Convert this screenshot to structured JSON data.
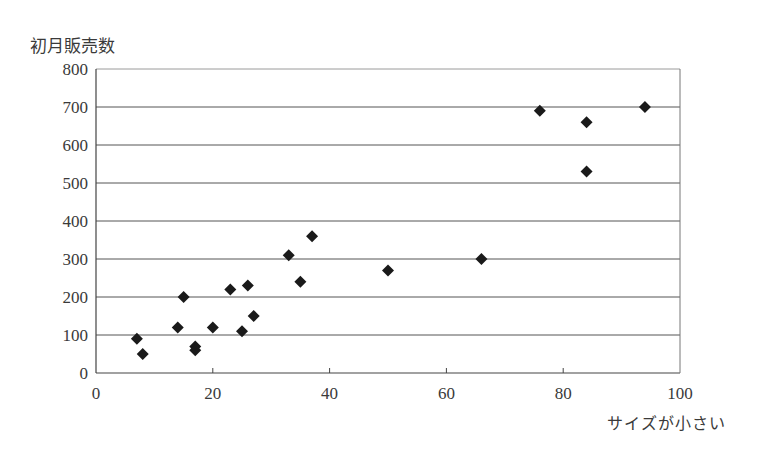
{
  "chart_data": {
    "type": "scatter",
    "title": "",
    "ylabel": "初月販売数",
    "xlabel": "サイズが小さい",
    "xlim": [
      0,
      100
    ],
    "ylim": [
      0,
      800
    ],
    "x_ticks": [
      0,
      20,
      40,
      60,
      80,
      100
    ],
    "y_ticks": [
      0,
      100,
      200,
      300,
      400,
      500,
      600,
      700,
      800
    ],
    "grid": {
      "horizontal": true,
      "vertical": false
    },
    "legend": null,
    "marker": "diamond",
    "marker_color": "#1a1a1a",
    "points": [
      {
        "x": 7,
        "y": 90
      },
      {
        "x": 8,
        "y": 50
      },
      {
        "x": 14,
        "y": 120
      },
      {
        "x": 15,
        "y": 200
      },
      {
        "x": 17,
        "y": 70
      },
      {
        "x": 17,
        "y": 60
      },
      {
        "x": 20,
        "y": 120
      },
      {
        "x": 23,
        "y": 220
      },
      {
        "x": 25,
        "y": 110
      },
      {
        "x": 26,
        "y": 230
      },
      {
        "x": 27,
        "y": 150
      },
      {
        "x": 33,
        "y": 310
      },
      {
        "x": 35,
        "y": 240
      },
      {
        "x": 37,
        "y": 360
      },
      {
        "x": 50,
        "y": 270
      },
      {
        "x": 66,
        "y": 300
      },
      {
        "x": 76,
        "y": 690
      },
      {
        "x": 84,
        "y": 660
      },
      {
        "x": 84,
        "y": 530
      },
      {
        "x": 94,
        "y": 700
      }
    ]
  }
}
